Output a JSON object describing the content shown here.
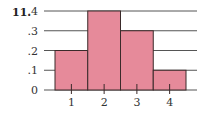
{
  "problem_number": "11.",
  "colors": {
    "bar_fill": "#E68A9A",
    "bar_stroke": "#3a2a2a",
    "grid": "#555555"
  },
  "chart_data": {
    "type": "bar",
    "subtype": "histogram",
    "title": "",
    "xlabel": "",
    "ylabel": "",
    "categories": [
      "1",
      "2",
      "3",
      "4"
    ],
    "values": [
      0.2,
      0.4,
      0.3,
      0.1
    ],
    "y_ticks": [
      "0",
      ".1",
      ".2",
      ".3",
      ".4"
    ],
    "ylim": [
      0,
      0.4
    ],
    "grid": true,
    "legend": null
  }
}
